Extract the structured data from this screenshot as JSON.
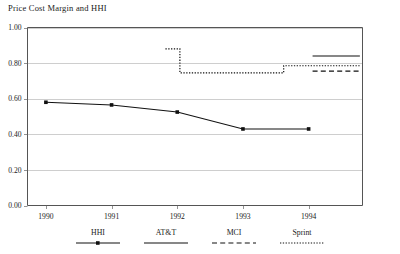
{
  "chart_data": {
    "type": "line",
    "title": "Price Cost Margin and HHI",
    "xlabel": "",
    "ylabel": "",
    "xlim": [
      1989.72,
      1994.82
    ],
    "ylim": [
      0.0,
      1.0
    ],
    "grid": true,
    "legend_position": "bottom",
    "x_ticks": [
      "1990",
      "1991",
      "1992",
      "1993",
      "1994"
    ],
    "x_tick_values": [
      1990,
      1991,
      1992,
      1993,
      1994
    ],
    "y_ticks": [
      "0.00",
      "0.20",
      "0.40",
      "0.60",
      "0.80",
      "1.00"
    ],
    "y_tick_values": [
      0.0,
      0.2,
      0.4,
      0.6,
      0.8,
      1.0
    ],
    "series": [
      {
        "name": "HHI",
        "style": "solid-with-markers",
        "x": [
          1990.0,
          1991.0,
          1992.0,
          1993.0,
          1994.0
        ],
        "values": [
          0.58,
          0.565,
          0.525,
          0.43,
          0.43
        ]
      },
      {
        "name": "AT&T",
        "style": "solid",
        "x": [
          1994.06,
          1994.78
        ],
        "values": [
          0.84,
          0.84
        ]
      },
      {
        "name": "MCI",
        "style": "dashed",
        "x": [
          1994.06,
          1994.78
        ],
        "values": [
          0.755,
          0.755
        ]
      },
      {
        "name": "Sprint",
        "style": "dotted",
        "x": [
          1991.82,
          1992.04,
          1992.04,
          1993.62,
          1993.62,
          1994.78
        ],
        "values": [
          0.88,
          0.88,
          0.745,
          0.745,
          0.785,
          0.785
        ]
      }
    ],
    "legend": [
      {
        "label": "HHI",
        "style": "solid-with-markers"
      },
      {
        "label": "AT&T",
        "style": "solid"
      },
      {
        "label": "MCI",
        "style": "dashed"
      },
      {
        "label": "Sprint",
        "style": "dotted"
      }
    ]
  }
}
